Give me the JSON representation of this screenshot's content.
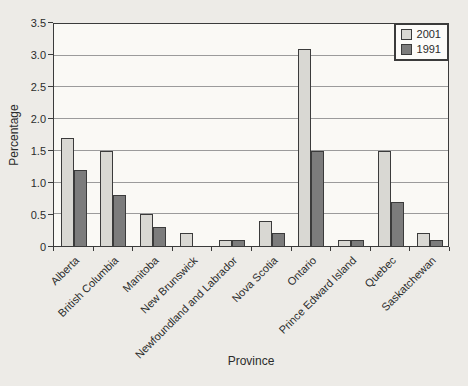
{
  "chart_data": {
    "type": "bar",
    "title": "",
    "xlabel": "Province",
    "ylabel": "Percentage",
    "categories": [
      "Alberta",
      "British Columbia",
      "Manitoba",
      "New Brunswick",
      "Newfoundland and Labrador",
      "Nova Scotia",
      "Ontario",
      "Prince Edward Island",
      "Quebec",
      "Saskatchewan"
    ],
    "series": [
      {
        "name": "2001",
        "color": "#d9d8d3",
        "values": [
          1.7,
          1.5,
          0.5,
          0.2,
          0.1,
          0.4,
          3.1,
          0.1,
          1.5,
          0.2
        ]
      },
      {
        "name": "1991",
        "color": "#7c7c7c",
        "values": [
          1.2,
          0.8,
          0.3,
          0,
          0.1,
          0.2,
          1.5,
          0.1,
          0.7,
          0.1
        ]
      }
    ],
    "ylim": [
      0,
      3.5
    ],
    "ytick_step": 0.5,
    "ytick_labels": [
      "0",
      "0.5",
      "1.0",
      "1.5",
      "2.0",
      "2.5",
      "3.0",
      "3.5"
    ],
    "grid": true,
    "legend_position": "top-right",
    "legend": [
      "2001",
      "1991"
    ]
  },
  "colors": {
    "page_bg": "#edebe7",
    "plot_bg": "#faf9f5",
    "axis": "#3b3b3b",
    "grid": "#9b9b9b",
    "series_2001": "#d9d8d3",
    "series_1991": "#7c7c7c"
  }
}
